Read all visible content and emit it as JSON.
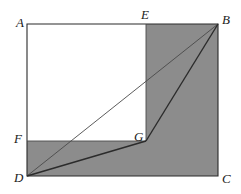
{
  "figure": {
    "kind": "plane-geometry-diagram",
    "canvas": {
      "width": 241,
      "height": 194
    },
    "colors": {
      "shade": "#8c8c8c",
      "stroke": "#2b2b2b",
      "thin_stroke": "#4a4a4a",
      "background": "#ffffff",
      "label": "#1a1a1a"
    },
    "stroke_widths": {
      "outline": 1.1,
      "segment_thin": 0.9,
      "segment_bold": 1.4
    },
    "points": [
      {
        "id": "A",
        "label": "A",
        "x": 27,
        "y": 24,
        "label_x": 16,
        "label_y": 16
      },
      {
        "id": "B",
        "label": "B",
        "x": 218,
        "y": 24,
        "label_x": 222,
        "label_y": 13
      },
      {
        "id": "C",
        "label": "C",
        "x": 218,
        "y": 176,
        "label_x": 222,
        "label_y": 172
      },
      {
        "id": "D",
        "label": "D",
        "x": 27,
        "y": 176,
        "label_x": 14,
        "label_y": 171
      },
      {
        "id": "E",
        "label": "E",
        "x": 146,
        "y": 24,
        "label_x": 141,
        "label_y": 8
      },
      {
        "id": "F",
        "label": "F",
        "x": 27,
        "y": 141,
        "label_x": 14,
        "label_y": 132
      },
      {
        "id": "G",
        "label": "G",
        "x": 146,
        "y": 141,
        "label_x": 134,
        "label_y": 130
      }
    ],
    "shaded_region": {
      "name": "L-shaped-shaded-region",
      "vertices": [
        "E",
        "B",
        "C",
        "D",
        "F",
        "G"
      ],
      "path": "M146,24 L218,24 L218,176 L27,176 L27,141 L146,141 Z"
    },
    "white_region": {
      "name": "rectangle-AEGF",
      "vertices": [
        "A",
        "E",
        "G",
        "F"
      ],
      "path": "M27,24 L146,24 L146,141 L27,141 Z"
    },
    "outline": {
      "name": "rectangle-ABCD",
      "path": "M27,24 L218,24 L218,176 L27,176 Z"
    },
    "internal_lines": [
      {
        "name": "segment-EG",
        "from": "E",
        "to": "G",
        "x1": 146,
        "y1": 24,
        "x2": 146,
        "y2": 141,
        "weight": "thin"
      },
      {
        "name": "segment-FG",
        "from": "F",
        "to": "G",
        "x1": 27,
        "y1": 141,
        "x2": 146,
        "y2": 141,
        "weight": "thin"
      },
      {
        "name": "segment-DB",
        "from": "D",
        "to": "B",
        "x1": 27,
        "y1": 176,
        "x2": 218,
        "y2": 24,
        "weight": "thin"
      },
      {
        "name": "segment-DG",
        "from": "D",
        "to": "G",
        "x1": 27,
        "y1": 176,
        "x2": 146,
        "y2": 141,
        "weight": "bold"
      },
      {
        "name": "segment-GB",
        "from": "G",
        "to": "B",
        "x1": 146,
        "y1": 141,
        "x2": 218,
        "y2": 24,
        "weight": "bold"
      }
    ]
  }
}
